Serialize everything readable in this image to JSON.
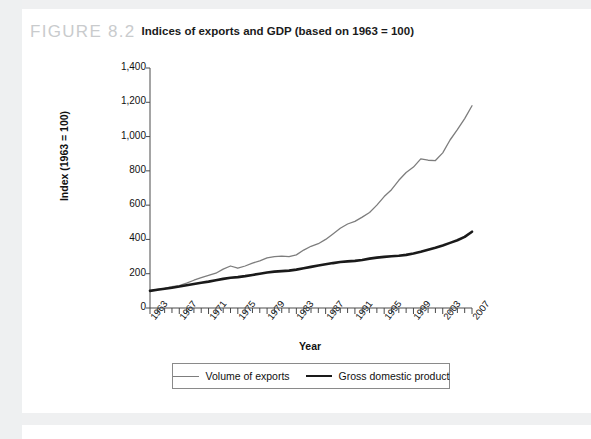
{
  "figure": {
    "number": "FIGURE 8.2",
    "caption": "Indices of exports and GDP (based on 1963 = 100)"
  },
  "chart_data": {
    "type": "line",
    "title": "Indices of exports and GDP (based on 1963 = 100)",
    "xlabel": "Year",
    "ylabel": "Index (1963 = 100)",
    "xlim": [
      1963,
      2007
    ],
    "ylim": [
      0,
      1400
    ],
    "ytick_labels": [
      "0",
      "200",
      "400",
      "600",
      "800",
      "1,000",
      "1,200",
      "1,400"
    ],
    "ytick_values": [
      0,
      200,
      400,
      600,
      800,
      1000,
      1200,
      1400
    ],
    "xtick_labels": [
      "1963",
      "1967",
      "1971",
      "1975",
      "1979",
      "1983",
      "1987",
      "1991",
      "1995",
      "1999",
      "2003",
      "2007"
    ],
    "xtick_values": [
      1963,
      1967,
      1971,
      1975,
      1979,
      1983,
      1987,
      1991,
      1995,
      1999,
      2003,
      2007
    ],
    "minor_xticks": "every year from 1963 to 2007",
    "grid": false,
    "legend_position": "below-axes",
    "x": [
      1963,
      1964,
      1965,
      1966,
      1967,
      1968,
      1969,
      1970,
      1971,
      1972,
      1973,
      1974,
      1975,
      1976,
      1977,
      1978,
      1979,
      1980,
      1981,
      1982,
      1983,
      1984,
      1985,
      1986,
      1987,
      1988,
      1989,
      1990,
      1991,
      1992,
      1993,
      1994,
      1995,
      1996,
      1997,
      1998,
      1999,
      2000,
      2001,
      2002,
      2003,
      2004,
      2005,
      2006,
      2007
    ],
    "series": [
      {
        "name": "Volume of exports",
        "color": "#7d7d7d",
        "line_width": 1.3,
        "values": [
          100,
          108,
          115,
          124,
          130,
          145,
          162,
          177,
          190,
          203,
          227,
          245,
          232,
          245,
          262,
          275,
          292,
          300,
          303,
          300,
          310,
          338,
          360,
          375,
          400,
          432,
          465,
          490,
          505,
          530,
          557,
          600,
          650,
          690,
          745,
          790,
          822,
          870,
          862,
          860,
          905,
          980,
          1040,
          1105,
          1180
        ]
      },
      {
        "name": "Gross domestic product",
        "color": "#1a1a1a",
        "line_width": 2.6,
        "values": [
          100,
          106,
          112,
          118,
          125,
          133,
          140,
          147,
          154,
          162,
          170,
          176,
          180,
          186,
          193,
          200,
          207,
          212,
          215,
          218,
          224,
          232,
          240,
          248,
          255,
          262,
          268,
          272,
          275,
          280,
          288,
          294,
          298,
          302,
          305,
          310,
          318,
          328,
          340,
          352,
          365,
          380,
          395,
          415,
          445
        ]
      }
    ]
  },
  "legend": {
    "items": [
      {
        "label": "Volume of exports",
        "style": "thin"
      },
      {
        "label": "Gross domestic product",
        "style": "thick"
      }
    ]
  }
}
